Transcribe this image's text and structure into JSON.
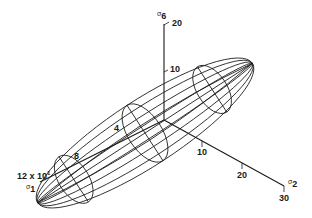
{
  "diagram": {
    "line_color": "#1a1a1a",
    "background": "#ffffff",
    "axes": {
      "sigma6": {
        "symbol": "σ",
        "index": "6",
        "ticks": [
          "10",
          "20"
        ]
      },
      "sigma2": {
        "symbol": "σ",
        "index": "2",
        "ticks": [
          "10",
          "20",
          "30"
        ]
      },
      "sigma1": {
        "symbol": "σ",
        "index": "1",
        "ticks": [
          "4",
          "8",
          "12 x 10"
        ],
        "scale_exponent": "1"
      }
    }
  }
}
